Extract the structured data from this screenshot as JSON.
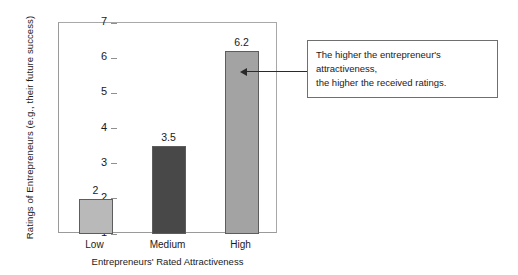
{
  "chart_data": {
    "type": "bar",
    "title": "",
    "xlabel": "Entrepreneurs' Rated Attractiveness",
    "ylabel": "Ratings of Entrepreneurs (e.g., their future success)",
    "categories": [
      "Low",
      "Medium",
      "High"
    ],
    "values": [
      2,
      3.5,
      6.2
    ],
    "value_labels": [
      "2",
      "3.5",
      "6.2"
    ],
    "bar_colors": [
      "#b9b9b9",
      "#484848",
      "#a3a3a3"
    ],
    "bar_border_color": "#5d5d5d",
    "ylim": [
      1,
      7
    ],
    "yticks": [
      1,
      2,
      3,
      4,
      5,
      6,
      7
    ],
    "ytick_labels": [
      "1",
      "2",
      "3",
      "4",
      "5",
      "6",
      "7"
    ],
    "grid": false,
    "legend": "none",
    "annotations": [
      {
        "name": "callout",
        "line1": "The higher the entrepreneur's attractiveness,",
        "line2": "the higher the received ratings.",
        "points_to": "High"
      }
    ]
  }
}
